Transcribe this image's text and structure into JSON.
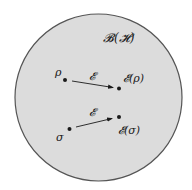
{
  "diagram": {
    "space_label": "𝓑(𝓗)",
    "colors": {
      "background": "#ffffff",
      "circle_fill": "#dcdcdc",
      "circle_stroke": "#555555",
      "ink": "#1a1a1a"
    },
    "states": [
      {
        "input_label": "ρ",
        "channel_label": "𝓔",
        "output_label": "𝓔(ρ)"
      },
      {
        "input_label": "σ",
        "channel_label": "𝓔",
        "output_label": "𝓔(σ)"
      }
    ]
  }
}
